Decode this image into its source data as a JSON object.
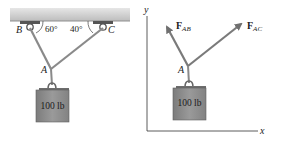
{
  "left_figure": {
    "support_labels": {
      "B": "B",
      "C": "C"
    },
    "angles": {
      "at_B": "60°",
      "at_C": "40°"
    },
    "joint_label": "A",
    "weight_label": "100 lb"
  },
  "right_figure": {
    "axes": {
      "x_label": "x",
      "y_label": "y"
    },
    "joint_label": "A",
    "forces": [
      {
        "name": "F",
        "subscript": "AB"
      },
      {
        "name": "F",
        "subscript": "AC"
      }
    ],
    "weight_label": "100 lb"
  },
  "colors": {
    "ceiling": "#cfcfcf",
    "cable": "#8a8a8a",
    "weight": "#8c8c8c",
    "arrow": "#7a7a7a",
    "axis": "#333333"
  }
}
